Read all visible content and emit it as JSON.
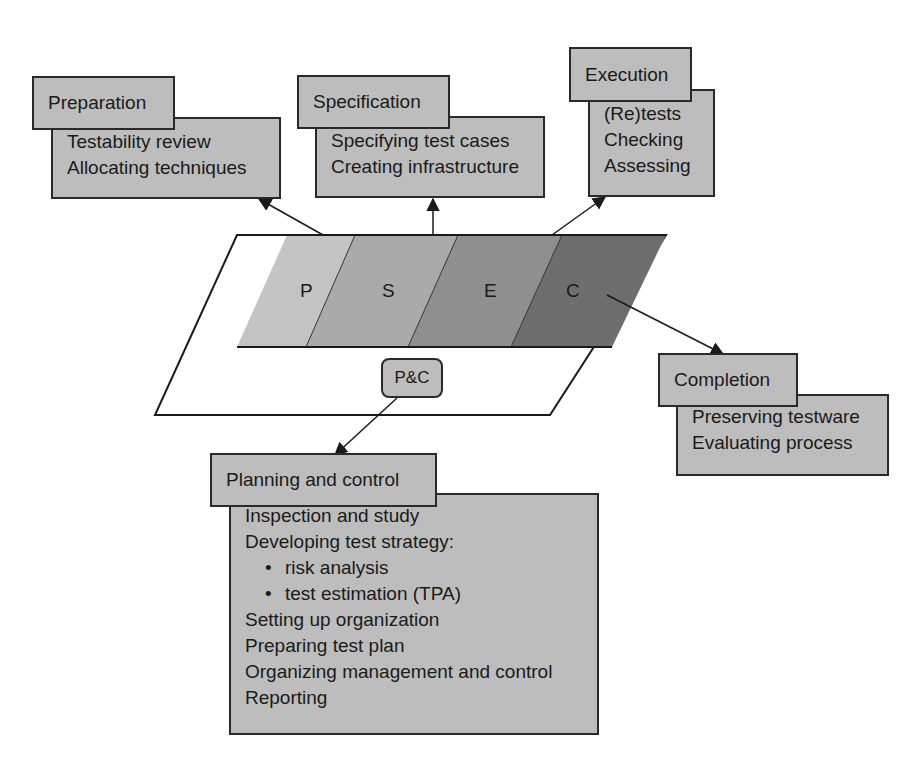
{
  "diagram": {
    "phases_band": {
      "labels": [
        "P",
        "S",
        "E",
        "C"
      ],
      "colors": [
        "#c4c4c4",
        "#aaaaaa",
        "#8f8f8f",
        "#6e6e6e"
      ]
    },
    "pc_badge": "P&C",
    "preparation": {
      "title": "Preparation",
      "items": [
        "Testability review",
        "Allocating techniques"
      ]
    },
    "specification": {
      "title": "Specification",
      "items": [
        "Specifying test cases",
        "Creating infrastructure"
      ]
    },
    "execution": {
      "title": "Execution",
      "items": [
        "(Re)tests",
        "Checking",
        "Assessing"
      ]
    },
    "completion": {
      "title": "Completion",
      "items": [
        "Preserving testware",
        "Evaluating process"
      ]
    },
    "planning_control": {
      "title": "Planning and control",
      "items": [
        {
          "text": "Inspection and study",
          "bullet": false
        },
        {
          "text": "Developing test strategy:",
          "bullet": false
        },
        {
          "text": "risk analysis",
          "bullet": true
        },
        {
          "text": "test estimation (TPA)",
          "bullet": true
        },
        {
          "text": "Setting up organization",
          "bullet": false
        },
        {
          "text": "Preparing test plan",
          "bullet": false
        },
        {
          "text": "Organizing management and control",
          "bullet": false
        },
        {
          "text": "Reporting",
          "bullet": false
        }
      ]
    }
  }
}
